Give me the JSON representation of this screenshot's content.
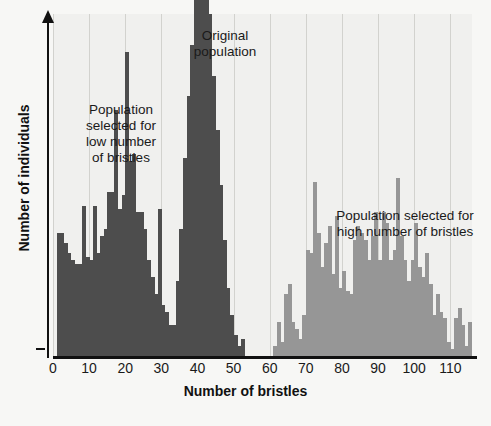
{
  "chart_data": {
    "type": "bar",
    "title": "",
    "subtitle": "",
    "xlabel": "Number of bristles",
    "ylabel": "Number of individuals",
    "xlim": [
      0,
      116
    ],
    "ylim": [
      0,
      100
    ],
    "grid": "vertical gridlines at every x tick",
    "legend_position": "in-plot text annotations",
    "xticks": [
      0,
      10,
      20,
      30,
      40,
      50,
      60,
      70,
      80,
      90,
      100,
      110
    ],
    "xtick_labels": [
      "0",
      "10",
      "20",
      "30",
      "40",
      "50",
      "60",
      "70",
      "80",
      "90",
      "100",
      "110"
    ],
    "yticks": [],
    "ytick_labels": [],
    "bin_width": 1,
    "annotations": [
      {
        "id": "low",
        "text": "Population\nselected for\nlow number\nof bristles",
        "x": 18,
        "y": 78
      },
      {
        "id": "orig",
        "text": "Original\npopulation",
        "x": 41,
        "y": 96
      },
      {
        "id": "high",
        "text": "Population selected for\nhigh number of bristles",
        "x": 92,
        "y": 48
      }
    ],
    "series": [
      {
        "name": "Population selected for low number of bristles",
        "color": "#4d4d4d",
        "x": [
          1,
          2,
          3,
          4,
          5,
          6,
          7,
          8,
          9,
          10,
          11,
          12,
          13,
          14,
          15,
          16,
          17,
          18,
          19,
          20,
          21,
          22,
          23,
          24,
          25,
          26,
          27,
          28,
          29,
          30,
          31,
          32,
          33,
          34
        ],
        "values": [
          36,
          36,
          33,
          30,
          28,
          27,
          27,
          44,
          29,
          28,
          44,
          30,
          35,
          37,
          48,
          48,
          72,
          43,
          47,
          89,
          57,
          59,
          42,
          42,
          37,
          28,
          23,
          18,
          43,
          15,
          13,
          9,
          5,
          2
        ]
      },
      {
        "name": "Original population",
        "color": "#4d4d4d",
        "x": [
          31,
          32,
          33,
          34,
          35,
          36,
          37,
          38,
          39,
          40,
          41,
          42,
          43,
          44,
          45,
          46,
          47,
          48,
          49,
          50,
          51,
          52
        ],
        "values": [
          2,
          5,
          9,
          22,
          37,
          58,
          76,
          91,
          108,
          137,
          122,
          135,
          100,
          82,
          66,
          50,
          34,
          20,
          12,
          6,
          3,
          5
        ]
      },
      {
        "name": "Population selected for high number of bristles",
        "color": "#969696",
        "x": [
          61,
          62,
          63,
          64,
          65,
          66,
          67,
          68,
          69,
          70,
          71,
          72,
          73,
          74,
          75,
          76,
          77,
          78,
          79,
          80,
          81,
          82,
          83,
          84,
          85,
          86,
          87,
          88,
          89,
          90,
          91,
          92,
          93,
          94,
          95,
          96,
          97,
          98,
          99,
          100,
          101,
          102,
          103,
          104,
          105,
          106,
          107,
          108,
          109,
          110,
          111,
          112,
          113,
          114,
          115
        ],
        "values": [
          3,
          10,
          4,
          18,
          21,
          10,
          8,
          5,
          12,
          31,
          30,
          51,
          36,
          26,
          33,
          38,
          24,
          41,
          20,
          25,
          19,
          18,
          34,
          38,
          36,
          34,
          28,
          35,
          42,
          28,
          42,
          39,
          28,
          31,
          52,
          35,
          28,
          22,
          28,
          39,
          26,
          23,
          30,
          21,
          12,
          18,
          13,
          11,
          4,
          2,
          11,
          14,
          9,
          3,
          10
        ]
      }
    ]
  },
  "axis": {
    "x_title": "Number of bristles",
    "y_title": "Number of individuals"
  },
  "colors": {
    "selected_low": "#4d4d4d",
    "original": "#4d4d4d",
    "selected_high": "#969696",
    "plot_background": "#f0f0ee",
    "page_background": "#f7f7f5",
    "axis": "#111111",
    "gridline": "#d2d2ce"
  }
}
